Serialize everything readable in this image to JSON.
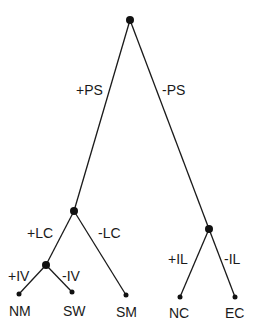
{
  "diagram": {
    "type": "binary feature tree",
    "root": {
      "id": "root"
    },
    "internal_nodes": [
      {
        "id": "root",
        "x": 130,
        "y": 20
      },
      {
        "id": "LC",
        "x": 74,
        "y": 211
      },
      {
        "id": "IV",
        "x": 46,
        "y": 265
      },
      {
        "id": "IL",
        "x": 209,
        "y": 229
      }
    ],
    "edges": [
      {
        "from": "root",
        "to": "LC",
        "label": "+PS"
      },
      {
        "from": "root",
        "to": "IL",
        "label": "-PS"
      },
      {
        "from": "LC",
        "to": "IV",
        "label": "+LC"
      },
      {
        "from": "LC",
        "to": "SM",
        "label": "-LC"
      },
      {
        "from": "IV",
        "to": "NM",
        "label": "+IV"
      },
      {
        "from": "IV",
        "to": "SW",
        "label": "-IV"
      },
      {
        "from": "IL",
        "to": "NC",
        "label": "+IL"
      },
      {
        "from": "IL",
        "to": "EC",
        "label": "-IL"
      }
    ],
    "leaves": [
      {
        "id": "NM",
        "label": "NM"
      },
      {
        "id": "SW",
        "label": "SW"
      },
      {
        "id": "SM",
        "label": "SM"
      },
      {
        "id": "NC",
        "label": "NC"
      },
      {
        "id": "EC",
        "label": "EC"
      }
    ],
    "edge_labels": {
      "plus_ps": "+PS",
      "minus_ps": "-PS",
      "plus_lc": "+LC",
      "minus_lc": "-LC",
      "plus_iv": "+IV",
      "minus_iv": "-IV",
      "plus_il": "+IL",
      "minus_il": "-IL"
    },
    "colors": {
      "line": "#1a1a1a",
      "node": "#111111",
      "background": "#ffffff"
    }
  }
}
